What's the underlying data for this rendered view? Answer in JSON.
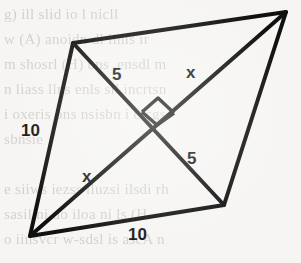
{
  "figure": {
    "shape": "rhombus",
    "stroke_color": "#101010",
    "background_color": "#f6f5f3",
    "vertices": {
      "top_left": [
        73,
        43
      ],
      "top_right": [
        286,
        12
      ],
      "bottom_right": [
        224,
        205
      ],
      "bottom_left": [
        30,
        236
      ]
    },
    "intersection": [
      157,
      124
    ],
    "right_angle_mark": "perpendicular-diagonals",
    "labels": [
      {
        "name": "upper-left-half-diagonal",
        "text": "5",
        "x": 112,
        "y": 66
      },
      {
        "name": "upper-right-half-diagonal",
        "text": "x",
        "x": 186,
        "y": 64
      },
      {
        "name": "left-side",
        "text": "10",
        "x": 21,
        "y": 122
      },
      {
        "name": "lower-right-half-diagonal",
        "text": "5",
        "x": 187,
        "y": 150
      },
      {
        "name": "lower-left-half-diagonal",
        "text": "x",
        "x": 82,
        "y": 168
      },
      {
        "name": "bottom-side",
        "text": "10",
        "x": 128,
        "y": 226
      }
    ]
  },
  "background_text": {
    "note": "faint bleed-through text from reverse side of scanned page",
    "lines": [
      "g) ill slid io l nicll",
      "w (A) anoidn dl linis ir",
      "m  shosrl (H) bns ,ensdl m",
      "n liass llns enls sil incrtsn",
      "i oxeris bns nsisbn  i cicgs",
      "sbnsie",
      "",
      "e siiws iezss iluzsi ilsdi rh",
      "sasil ni do iloa ni  ls (H",
      "o iinsvcr w-sdsl is ascA n"
    ]
  }
}
